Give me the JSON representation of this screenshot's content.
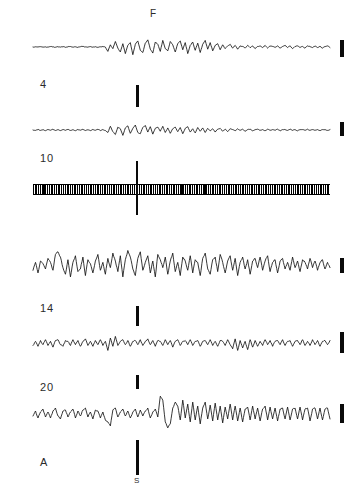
{
  "figure": {
    "background_color": "#ffffff",
    "ink_color": "#111111",
    "width": 358,
    "height": 501
  },
  "annotations": {
    "top_marker_label": "F",
    "stimulus_label": "S"
  },
  "traces": [
    {
      "label": "4",
      "baseline_y": 47,
      "label_x": 40,
      "label_y": 78,
      "x_start": 33,
      "x_end": 330,
      "calbar": {
        "x": 340,
        "y": 40,
        "height": 17
      },
      "stimbar": {
        "x": 136,
        "y": 85,
        "height": 22
      }
    },
    {
      "label": "10",
      "baseline_y": 130,
      "label_x": 40,
      "label_y": 152,
      "x_start": 33,
      "x_end": 330,
      "calbar": {
        "x": 340,
        "y": 122,
        "height": 14
      },
      "stimbar": null
    },
    {
      "label": "",
      "baseline_y": 188,
      "label_x": 0,
      "label_y": 0,
      "x_start": 33,
      "x_end": 330,
      "calbar": null,
      "stimbar": null,
      "is_band": true,
      "cross": {
        "x": 136,
        "y": 161,
        "height": 54
      }
    },
    {
      "label": "14",
      "baseline_y": 265,
      "label_x": 40,
      "label_y": 302,
      "x_start": 33,
      "x_end": 330,
      "calbar": {
        "x": 340,
        "y": 258,
        "height": 15
      },
      "stimbar": {
        "x": 136,
        "y": 306,
        "height": 20
      }
    },
    {
      "label": "20",
      "baseline_y": 343,
      "label_x": 40,
      "label_y": 381,
      "x_start": 33,
      "x_end": 330,
      "calbar": {
        "x": 340,
        "y": 332,
        "height": 21
      },
      "stimbar": {
        "x": 136,
        "y": 375,
        "height": 14
      }
    },
    {
      "label": "A",
      "baseline_y": 414,
      "label_x": 40,
      "label_y": 456,
      "x_start": 33,
      "x_end": 330,
      "calbar": {
        "x": 340,
        "y": 404,
        "height": 19
      },
      "stimbar": {
        "x": 136,
        "y": 440,
        "height": 35
      }
    }
  ],
  "chart_data": {
    "type": "line",
    "title": "",
    "xlabel": "",
    "ylabel": "",
    "grid": false,
    "legend": "none",
    "series": [
      {
        "name": "4",
        "baseline": 47,
        "amplitude_scale": 1.0,
        "values": [
          0,
          0.4,
          -0.3,
          0.6,
          -0.2,
          0.3,
          -0.5,
          0.8,
          0.2,
          -0.4,
          0.5,
          -0.2,
          0.7,
          -0.6,
          0.3,
          0.9,
          -0.3,
          0.4,
          -0.7,
          0.5,
          1.1,
          0.2,
          -0.5,
          0.8,
          -0.3,
          0.6,
          -0.9,
          0.4,
          0.7,
          -0.2,
          -8,
          4,
          -3,
          10,
          -2,
          -9,
          6,
          -12,
          3,
          8,
          -14,
          5,
          11,
          -6,
          -10,
          7,
          13,
          -4,
          -11,
          9,
          5,
          -8,
          12,
          -3,
          -7,
          10,
          4,
          -9,
          6,
          11,
          -5,
          8,
          -12,
          3,
          9,
          -6,
          7,
          -10,
          5,
          12,
          -4,
          8,
          -7,
          3,
          6,
          -5,
          4,
          -3,
          2,
          5,
          -2,
          3,
          -4,
          2,
          1,
          -2,
          3,
          -1,
          2,
          -3,
          1,
          2,
          -1,
          3,
          -2,
          2,
          1,
          -1,
          2,
          -2,
          1,
          3,
          -1,
          2,
          -3,
          1,
          2,
          -1,
          1,
          -2,
          2,
          1,
          -1,
          2,
          -1,
          1,
          -2,
          1,
          2,
          -1
        ]
      },
      {
        "name": "10",
        "baseline": 130,
        "amplitude_scale": 0.75,
        "values": [
          0,
          -1,
          1.5,
          -1,
          0.8,
          -1.6,
          1.2,
          -0.6,
          1.8,
          -1.2,
          0.7,
          -1.4,
          1.1,
          -0.8,
          1.5,
          -1.1,
          0.9,
          -1.7,
          1.3,
          -0.5,
          1.6,
          -1.3,
          0.8,
          -1.5,
          1.2,
          -0.7,
          1.9,
          -1.4,
          1.0,
          -1.2,
          -6,
          9,
          -4,
          -11,
          7,
          3,
          -13,
          5,
          10,
          -8,
          4,
          12,
          -6,
          -9,
          6,
          11,
          -5,
          8,
          -10,
          4,
          7,
          -3,
          9,
          -6,
          5,
          -8,
          3,
          7,
          -4,
          6,
          -9,
          4,
          8,
          -5,
          3,
          -7,
          6,
          -3,
          5,
          -6,
          4,
          -2,
          3,
          -5,
          2,
          4,
          -3,
          2,
          -4,
          3,
          1,
          -2,
          3,
          -1,
          2,
          -3,
          1,
          2,
          -2,
          1,
          2,
          -1,
          1,
          -2,
          2,
          -1,
          1,
          -1,
          2,
          -2,
          1,
          1,
          -1,
          2,
          -1,
          1,
          -2,
          1,
          1,
          -1,
          2,
          -1,
          1,
          -1,
          1,
          -2,
          1,
          1,
          -1,
          1
        ]
      },
      {
        "name": "band",
        "baseline": 188,
        "amplitude_scale": 0,
        "values": []
      },
      {
        "name": "14",
        "baseline": 265,
        "amplitude_scale": 2.4,
        "values": [
          -4,
          2,
          -6,
          3,
          1,
          -3,
          5,
          2,
          -4,
          8,
          10,
          6,
          -2,
          -7,
          4,
          -9,
          2,
          7,
          -5,
          -3,
          6,
          -8,
          4,
          1,
          -6,
          3,
          8,
          -4,
          2,
          -7,
          5,
          -2,
          9,
          3,
          -5,
          7,
          -9,
          4,
          11,
          6,
          -3,
          -8,
          5,
          10,
          -4,
          2,
          7,
          -6,
          3,
          -9,
          8,
          4,
          -2,
          6,
          -7,
          3,
          9,
          -5,
          2,
          -8,
          6,
          3,
          -4,
          7,
          -6,
          4,
          2,
          -8,
          5,
          9,
          -3,
          -7,
          4,
          6,
          -5,
          8,
          2,
          -6,
          3,
          7,
          -4,
          5,
          -8,
          2,
          6,
          -3,
          4,
          -7,
          3,
          5,
          -2,
          6,
          -4,
          3,
          7,
          -5,
          2,
          4,
          -6,
          3,
          5,
          -3,
          2,
          -4,
          6,
          -2,
          3,
          -5,
          4,
          2,
          -3,
          5,
          -2,
          3,
          -4,
          2,
          4,
          -3,
          2,
          -2
        ]
      },
      {
        "name": "20",
        "baseline": 343,
        "amplitude_scale": 1.5,
        "values": [
          -3,
          2,
          -4,
          3,
          -2,
          4,
          -3,
          2,
          -5,
          3,
          4,
          -2,
          -4,
          3,
          2,
          -3,
          4,
          -2,
          3,
          -4,
          2,
          5,
          -3,
          2,
          -4,
          3,
          -2,
          4,
          -3,
          2,
          -9,
          6,
          -4,
          8,
          -3,
          2,
          4,
          -2,
          3,
          -4,
          2,
          3,
          -2,
          4,
          -3,
          2,
          5,
          -2,
          3,
          -4,
          3,
          2,
          -3,
          4,
          -2,
          3,
          -5,
          2,
          4,
          -3,
          2,
          3,
          -2,
          4,
          -3,
          2,
          3,
          -4,
          2,
          3,
          -2,
          4,
          -3,
          2,
          -4,
          3,
          2,
          -3,
          4,
          -2,
          -7,
          5,
          -9,
          3,
          -6,
          2,
          -8,
          4,
          -5,
          3,
          -4,
          2,
          -3,
          4,
          -2,
          3,
          -4,
          2,
          3,
          -2,
          4,
          -3,
          2,
          3,
          -4,
          2,
          3,
          -2,
          4,
          -3,
          2,
          -3,
          4,
          -2,
          3,
          -4,
          2,
          3,
          -2,
          3
        ]
      },
      {
        "name": "A",
        "baseline": 414,
        "amplitude_scale": 1.8,
        "values": [
          -2,
          3,
          -4,
          2,
          5,
          -3,
          2,
          -4,
          3,
          6,
          -2,
          -5,
          3,
          4,
          -3,
          2,
          5,
          -4,
          3,
          -2,
          4,
          6,
          -3,
          2,
          -5,
          4,
          3,
          -4,
          2,
          -6,
          -8,
          -12,
          4,
          6,
          -3,
          2,
          5,
          -2,
          3,
          -4,
          2,
          5,
          -3,
          4,
          -2,
          3,
          6,
          -4,
          2,
          5,
          -3,
          18,
          14,
          -8,
          -14,
          -10,
          6,
          12,
          8,
          -6,
          14,
          -4,
          10,
          -8,
          12,
          -6,
          8,
          -10,
          6,
          12,
          -5,
          9,
          -7,
          11,
          -6,
          8,
          -9,
          7,
          -5,
          10,
          -6,
          8,
          -7,
          6,
          -8,
          5,
          7,
          -6,
          8,
          -5,
          6,
          -7,
          5,
          8,
          -6,
          7,
          -5,
          6,
          -7,
          5,
          6,
          -5,
          7,
          -6,
          5,
          6,
          -5,
          7,
          -6,
          5,
          6,
          -7,
          5,
          6,
          -5,
          6,
          -6,
          5,
          6,
          -5
        ]
      }
    ]
  }
}
